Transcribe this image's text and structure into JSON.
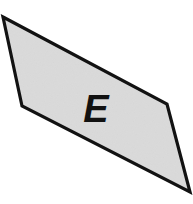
{
  "figure": {
    "canvas": {
      "width": 193,
      "height": 204,
      "background_color": "#ffffff"
    },
    "shapes": [
      {
        "name": "quadrilateral-region-e",
        "kind": "polygon",
        "label": "E",
        "label_position": {
          "x": 96,
          "y": 122
        },
        "vertices": [
          {
            "x": 3,
            "y": 17
          },
          {
            "x": 167,
            "y": 104
          },
          {
            "x": 190,
            "y": 192
          },
          {
            "x": 22,
            "y": 106
          }
        ],
        "fill_color": "#e7e7e7",
        "stroke_color": "#121212",
        "stroke_width": 3.2,
        "texture": "fine-gray-noise"
      }
    ]
  }
}
